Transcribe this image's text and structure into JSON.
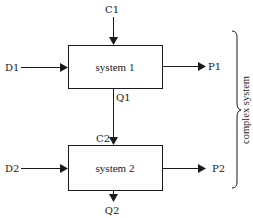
{
  "diagram": {
    "type": "block-diagram",
    "colors": {
      "stroke": "#1a1a1a",
      "background": "#ffffff"
    },
    "nodes": [
      {
        "id": "system1",
        "label": "system 1"
      },
      {
        "id": "system2",
        "label": "system 2"
      }
    ],
    "inputs": {
      "c1": "C1",
      "d1": "D1",
      "c2": "C2",
      "d2": "D2"
    },
    "outputs": {
      "p1": "P1",
      "q1": "Q1",
      "p2": "P2",
      "q2": "Q2"
    },
    "edges": [
      {
        "from": "C1",
        "to": "system1"
      },
      {
        "from": "D1",
        "to": "system1"
      },
      {
        "from": "system1",
        "to": "P1"
      },
      {
        "from": "system1",
        "to": "system2",
        "labels": [
          "Q1",
          "C2"
        ]
      },
      {
        "from": "D2",
        "to": "system2"
      },
      {
        "from": "system2",
        "to": "P2"
      },
      {
        "from": "system2",
        "to": "Q2"
      }
    ],
    "group": {
      "label": "complex system",
      "members": [
        "system1",
        "system2"
      ]
    }
  }
}
